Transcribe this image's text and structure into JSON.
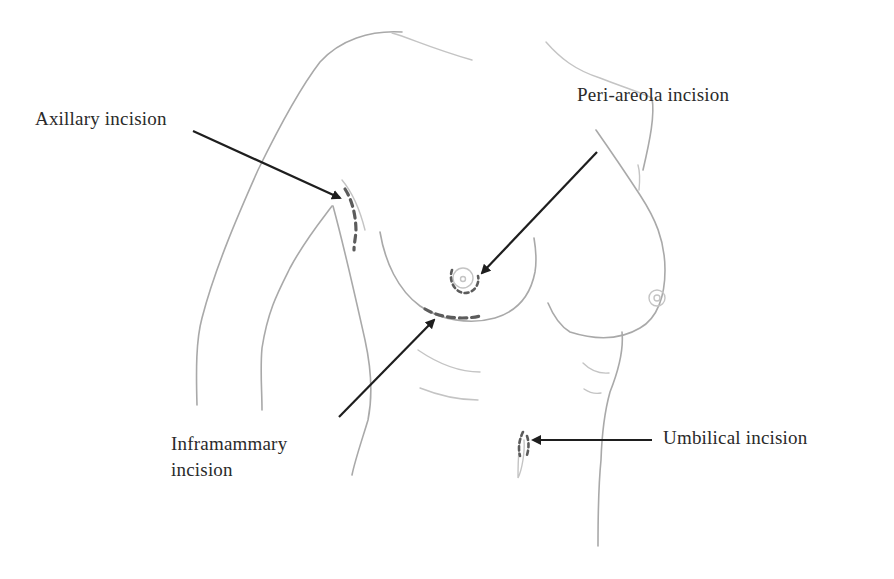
{
  "diagram": {
    "type": "anatomical-sketch",
    "colors": {
      "background": "#ffffff",
      "outline": "#a9a9a9",
      "incision": "#5c5c5c",
      "arrow": "#1e1e1e",
      "text": "#2a2a2a"
    },
    "labels": {
      "axillary": "Axillary incision",
      "periareola": "Peri-areola incision",
      "inframammary_line1": "Inframammary",
      "inframammary_line2": "incision",
      "umbilical": "Umbilical incision"
    },
    "annotations": [
      {
        "id": "axillary",
        "label": "Axillary incision",
        "arrow_from": [
          193,
          131
        ],
        "arrow_to": [
          343,
          199
        ]
      },
      {
        "id": "periareola",
        "label": "Peri-areola incision",
        "arrow_from": [
          597,
          152
        ],
        "arrow_to": [
          479,
          276
        ]
      },
      {
        "id": "inframammary",
        "label": "Inframammary incision",
        "arrow_from": [
          339,
          417
        ],
        "arrow_to": [
          436,
          318
        ]
      },
      {
        "id": "umbilical",
        "label": "Umbilical incision",
        "arrow_from": [
          652,
          440
        ],
        "arrow_to": [
          530,
          440
        ]
      }
    ]
  }
}
